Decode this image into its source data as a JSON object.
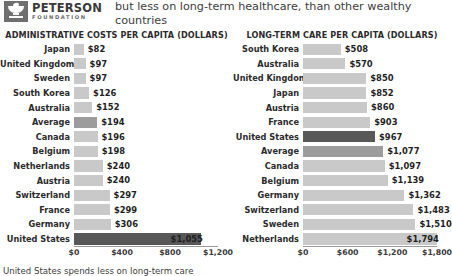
{
  "brand": {
    "name": "PETERSON",
    "sub": "FOUNDATION",
    "logo_icon": "peterson-bowl-logo"
  },
  "headline": "but less on long-term healthcare, than other wealthy countries",
  "footnote": "United States spends less on long-term care",
  "colors": {
    "bar": "#c9c9c9",
    "bar_average": "#9c9c9c",
    "bar_highlight": "#585858",
    "text": "#2b2b2b"
  },
  "chart_data": [
    {
      "type": "bar",
      "orientation": "horizontal",
      "id": "administrative-costs",
      "title": "Administrative Costs per Capita (Dollars)",
      "xlabel": "",
      "ylabel": "",
      "xlim": [
        0,
        1200
      ],
      "ticks": [
        "$0",
        "$400",
        "$800",
        "$1,200"
      ],
      "tick_values": [
        0,
        400,
        800,
        1200
      ],
      "grid": false,
      "legend": "none",
      "categories": [
        "Japan",
        "United Kingdom",
        "Sweden",
        "South Korea",
        "Australia",
        "Average",
        "Canada",
        "Belgium",
        "Netherlands",
        "Austria",
        "Switzerland",
        "France",
        "Germany",
        "United States"
      ],
      "values": [
        82,
        97,
        97,
        126,
        152,
        194,
        196,
        198,
        240,
        240,
        297,
        299,
        306,
        1055
      ],
      "labels": [
        "$82",
        "$97",
        "$97",
        "$126",
        "$152",
        "$194",
        "$196",
        "$198",
        "$240",
        "$240",
        "$297",
        "$299",
        "$306",
        "$1,055"
      ],
      "styles": [
        "normal",
        "normal",
        "normal",
        "normal",
        "normal",
        "average",
        "normal",
        "normal",
        "normal",
        "normal",
        "normal",
        "normal",
        "normal",
        "highlight"
      ]
    },
    {
      "type": "bar",
      "orientation": "horizontal",
      "id": "long-term-care",
      "title": "Long-Term Care per Capita (Dollars)",
      "xlabel": "",
      "ylabel": "",
      "xlim": [
        0,
        1800
      ],
      "ticks": [
        "$0",
        "$600",
        "$1,200",
        "$1,800"
      ],
      "tick_values": [
        0,
        600,
        1200,
        1800
      ],
      "grid": false,
      "legend": "none",
      "categories": [
        "South Korea",
        "Australia",
        "United Kingdom",
        "Japan",
        "Austria",
        "France",
        "United States",
        "Average",
        "Canada",
        "Belgium",
        "Germany",
        "Switzerland",
        "Sweden",
        "Netherlands"
      ],
      "values": [
        508,
        570,
        850,
        852,
        860,
        903,
        967,
        1077,
        1097,
        1139,
        1362,
        1483,
        1510,
        1794
      ],
      "labels": [
        "$508",
        "$570",
        "$850",
        "$852",
        "$860",
        "$903",
        "$967",
        "$1,077",
        "$1,097",
        "$1,139",
        "$1,362",
        "$1,483",
        "$1,510",
        "$1,794"
      ],
      "styles": [
        "normal",
        "normal",
        "normal",
        "normal",
        "normal",
        "normal",
        "highlight",
        "average",
        "normal",
        "normal",
        "normal",
        "normal",
        "normal",
        "normal"
      ]
    }
  ]
}
